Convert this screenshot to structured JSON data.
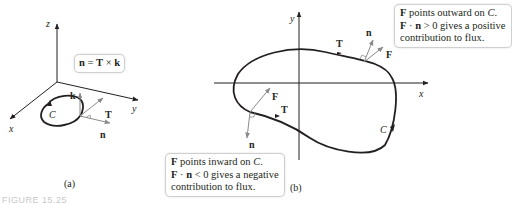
{
  "panel_a": {
    "axes": {
      "x": "x",
      "y": "y",
      "z": "z"
    },
    "formula_box": {
      "n": "n",
      "eq": " = ",
      "T": "T",
      "times": " × ",
      "k": "k"
    },
    "labels": {
      "curve": "C",
      "k": "k",
      "T": "T",
      "n": "n"
    },
    "caption": "(a)"
  },
  "panel_b": {
    "axes": {
      "x": "x",
      "y": "y"
    },
    "labels": {
      "curve": "C",
      "T_top": "T",
      "n_top": "n",
      "F_top": "F",
      "T_left": "T",
      "F_left": "F",
      "n_left": "n"
    },
    "outward_note": {
      "line1_F": "F",
      "line1_rest": " points outward on ",
      "line1_C": "C",
      "line1_end": ".",
      "line2_F": "F",
      "line2_dot": " · ",
      "line2_n": "n",
      "line2_rest": " > 0 gives a positive",
      "line3": "contribution to flux."
    },
    "inward_note": {
      "line1_F": "F",
      "line1_rest": " points inward on ",
      "line1_C": "C",
      "line1_end": ".",
      "line2_F": "F",
      "line2_dot": " · ",
      "line2_n": "n",
      "line2_rest": " < 0 gives a negative",
      "line3": "contribution to flux."
    },
    "caption": "(b)"
  },
  "figure_label": "FIGURE 15.25",
  "colors": {
    "ink": "#231f20",
    "vector_gray": "#8a8a8a",
    "box_border": "#cfcfcf",
    "figure_label": "#c7c7c7"
  }
}
